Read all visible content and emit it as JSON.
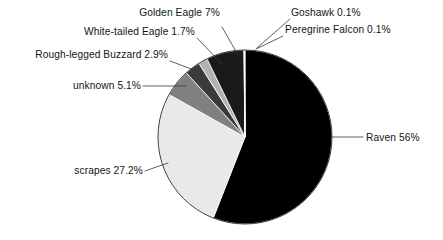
{
  "chart_data": {
    "type": "pie",
    "title": "",
    "subtitle": "",
    "xlabel": "",
    "ylabel": "",
    "legend_position": "none",
    "grid": false,
    "label_format": "name + percent",
    "categories": [
      "Raven",
      "scrapes",
      "unknown",
      "Rough-legged Buzzard",
      "White-tailed Eagle",
      "Golden Eagle",
      "Goshawk",
      "Peregrine Falcon"
    ],
    "values": [
      56,
      27.2,
      5.1,
      2.9,
      1.7,
      7,
      0.1,
      0.1
    ],
    "colors": [
      "#000000",
      "#e9e9e9",
      "#808080",
      "#3a3a3a",
      "#b2b2b2",
      "#1a1a1a",
      "#ffffff",
      "#f2f2f2"
    ],
    "slices": [
      {
        "name": "Raven",
        "value": 56,
        "label": "Raven 56%",
        "color": "#000000"
      },
      {
        "name": "scrapes",
        "value": 27.2,
        "label": "scrapes 27.2%",
        "color": "#e9e9e9"
      },
      {
        "name": "unknown",
        "value": 5.1,
        "label": "unknown 5.1%",
        "color": "#808080"
      },
      {
        "name": "Rough-legged Buzzard",
        "value": 2.9,
        "label": "Rough-legged Buzzard 2.9%",
        "color": "#3a3a3a"
      },
      {
        "name": "White-tailed Eagle",
        "value": 1.7,
        "label": "White-tailed Eagle 1.7%",
        "color": "#b2b2b2"
      },
      {
        "name": "Golden Eagle",
        "value": 7,
        "label": "Golden Eagle 7%",
        "color": "#1a1a1a"
      },
      {
        "name": "Goshawk",
        "value": 0.1,
        "label": "Goshawk 0.1%",
        "color": "#ffffff"
      },
      {
        "name": "Peregrine Falcon",
        "value": 0.1,
        "label": "Peregrine Falcon 0.1%",
        "color": "#f2f2f2"
      }
    ]
  },
  "labels": {
    "golden_eagle": "Golden Eagle 7%",
    "goshawk": "Goshawk 0.1%",
    "peregrine_falcon": "Peregrine Falcon 0.1%",
    "white_tailed_eagle": "White-tailed Eagle 1.7%",
    "rough_legged_buzzard": "Rough-legged Buzzard 2.9%",
    "unknown": "unknown 5.1%",
    "scrapes": "scrapes 27.2%",
    "raven": "Raven 56%"
  }
}
